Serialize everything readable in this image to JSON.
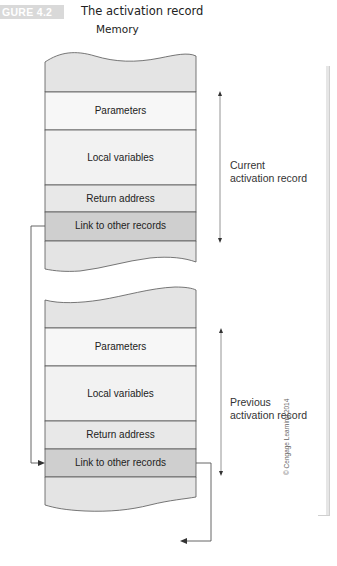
{
  "figure": {
    "tag": "GURE 4.2",
    "title": "The activation record",
    "memory_label": "Memory"
  },
  "current_record": {
    "cells": [
      {
        "label": "Parameters",
        "fill": "#f7f7f7"
      },
      {
        "label": "Local variables",
        "fill": "#f2f2f2"
      },
      {
        "label": "Return address",
        "fill": "#e8e8e8"
      },
      {
        "label": "Link to other records",
        "fill": "#cfcfcf"
      }
    ],
    "side_label_line1": "Current",
    "side_label_line2": "activation record"
  },
  "previous_record": {
    "cells": [
      {
        "label": "Parameters",
        "fill": "#f7f7f7"
      },
      {
        "label": "Local variables",
        "fill": "#f2f2f2"
      },
      {
        "label": "Return address",
        "fill": "#e8e8e8"
      },
      {
        "label": "Link to other records",
        "fill": "#cfcfcf"
      }
    ],
    "side_label_line1": "Previous",
    "side_label_line2": "activation record"
  },
  "copyright": "© Cengage Learning 2014",
  "colors": {
    "empty_fill": "#e4e4e4",
    "link_fill": "#cfcfcf",
    "line": "#555555",
    "arrow": "#777777"
  }
}
